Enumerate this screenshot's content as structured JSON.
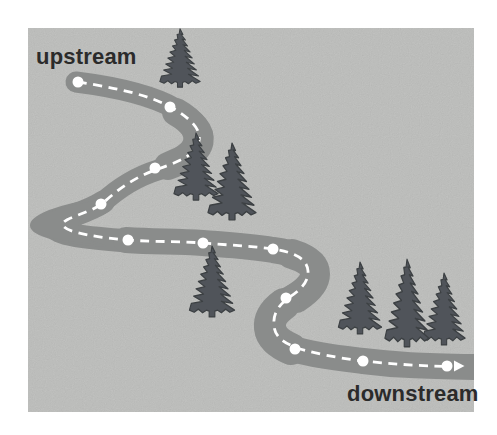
{
  "diagram": {
    "title_semantics": "river upstream-downstream flow diagram",
    "canvas": {
      "width": 497,
      "height": 435,
      "background_color": "#ffffff"
    },
    "panel": {
      "x": 28,
      "y": 28,
      "width": 446,
      "height": 384,
      "color": "#c7c8c6"
    },
    "labels": {
      "upstream": {
        "text": "upstream",
        "x": 36,
        "y": 44,
        "font_size": 22,
        "color": "#2b2b2b"
      },
      "downstream": {
        "text": "downstream",
        "x": 347,
        "y": 381,
        "font_size": 22,
        "color": "#2b2b2b"
      }
    },
    "river": {
      "color": "#8a8c8b",
      "segments": [
        {
          "d": "M 76 82 C 108 86, 148 93, 176 109 C 196 120, 205 130, 203 142 C 201 155, 186 162, 158 170 C 135 177, 116 190, 101 204",
          "width": 21
        },
        {
          "d": "M 103 202 C 85 214, 58 218, 55 226 C 53 234, 85 238, 130 241",
          "width": 23
        },
        {
          "d": "M 126 240 C 155 242, 175 241, 203 243 C 228 245, 248 246, 273 250 C 295 253, 312 259, 314 273 C 316 287, 300 293, 288 300 C 276 308, 272 316, 273 327 C 274 338, 281 344, 297 350 C 318 356, 338 358, 363 361 C 395 365, 420 366, 474 367",
          "width": 26
        },
        {
          "d": "M 176 112 C 192 121, 199 131, 197 142 C 195 154, 184 160, 168 166",
          "width": 28
        },
        {
          "d": "M 292 254 C 308 259, 315 265, 315 274 C 315 283, 307 291, 296 298",
          "width": 30
        },
        {
          "d": "M 284 304 C 273 312, 269 319, 270 328 C 271 337, 278 343, 291 349",
          "width": 32
        }
      ],
      "hairpin_blob": "M 100 199 C 58 205, 30 216, 31 226 C 32 236, 62 243, 105 246 C 85 240, 78 233, 79 226 C 80 219, 88 206, 100 199 Z"
    },
    "flow_line": {
      "color": "#ffffff",
      "width": 2.8,
      "dash": "9 6.5",
      "d": "M 78 82 C 110 87, 150 94, 176 110 C 193 121, 201 130, 199 141 C 197 153, 184 160, 158 169 C 136 176, 116 191, 103 203 C 90 213, 67 217, 63 223 C 60 230, 82 236, 128 240 C 155 242, 176 241, 203 243 C 228 245, 250 246, 273 249 C 293 252, 307 258, 308 271 C 309 284, 297 292, 287 299 C 277 307, 273 315, 274 326 C 275 336, 282 342, 297 348 C 317 354, 338 358, 363 361 C 393 364, 420 366, 451 366.5"
    },
    "arrow": {
      "points": "454,360.5 464.5,366 454,371.5",
      "color": "#ffffff"
    },
    "sampling_points": {
      "color": "#ffffff",
      "radius": 5.5,
      "positions": [
        [
          78,
          82
        ],
        [
          170,
          107
        ],
        [
          155,
          168
        ],
        [
          101,
          204
        ],
        [
          128,
          240
        ],
        [
          203,
          243
        ],
        [
          273,
          249
        ],
        [
          286,
          298
        ],
        [
          295,
          349
        ],
        [
          363,
          361
        ],
        [
          447,
          366
        ]
      ]
    },
    "trees": {
      "fill": "#50545a",
      "stroke": "#3c4043",
      "positions": [
        {
          "cx": 180,
          "top": 28,
          "w": 42,
          "h": 60
        },
        {
          "cx": 196,
          "top": 132,
          "w": 46,
          "h": 69
        },
        {
          "cx": 232,
          "top": 142,
          "w": 50,
          "h": 79
        },
        {
          "cx": 212,
          "top": 245,
          "w": 47,
          "h": 73
        },
        {
          "cx": 360,
          "top": 261,
          "w": 45,
          "h": 74
        },
        {
          "cx": 444,
          "top": 272,
          "w": 44,
          "h": 74
        },
        {
          "cx": 407,
          "top": 258,
          "w": 46,
          "h": 90
        }
      ]
    }
  }
}
